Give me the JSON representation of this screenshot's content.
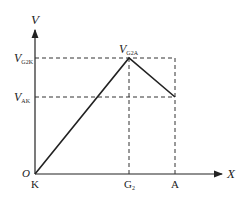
{
  "diagram": {
    "type": "potential-profile",
    "axes": {
      "y_label": "V",
      "x_label": "X",
      "origin_label": "O"
    },
    "y_levels": [
      {
        "main": "V",
        "sub": "G2K"
      },
      {
        "main": "V",
        "sub": "AK"
      }
    ],
    "peak_label": {
      "main": "V",
      "sub": "G2A"
    },
    "x_positions": [
      {
        "main": "K",
        "sub": ""
      },
      {
        "main": "G",
        "sub": "2"
      },
      {
        "main": "A",
        "sub": ""
      }
    ],
    "colors": {
      "line": "#222222",
      "dashed": "#333333"
    }
  }
}
